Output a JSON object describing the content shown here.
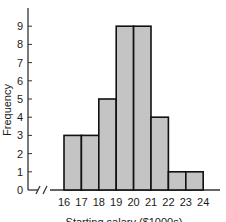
{
  "chart_data": {
    "type": "bar",
    "subtype": "histogram",
    "title": "",
    "xlabel": "Starting salary ($1000s)",
    "ylabel": "Frequency",
    "x_tick_labels": [
      "16",
      "17",
      "18",
      "19",
      "20",
      "21",
      "22",
      "23",
      "24"
    ],
    "y_tick_labels": [
      "0",
      "1",
      "2",
      "3",
      "4",
      "5",
      "6",
      "7",
      "8",
      "9"
    ],
    "bins": [
      {
        "from": 16,
        "to": 17,
        "count": 3
      },
      {
        "from": 17,
        "to": 18,
        "count": 3
      },
      {
        "from": 18,
        "to": 19,
        "count": 5
      },
      {
        "from": 19,
        "to": 20,
        "count": 9
      },
      {
        "from": 20,
        "to": 21,
        "count": 9
      },
      {
        "from": 21,
        "to": 22,
        "count": 4
      },
      {
        "from": 22,
        "to": 23,
        "count": 1
      },
      {
        "from": 23,
        "to": 24,
        "count": 1
      }
    ],
    "categories": [
      "16-17",
      "17-18",
      "18-19",
      "19-20",
      "20-21",
      "21-22",
      "22-23",
      "23-24"
    ],
    "values": [
      3,
      3,
      5,
      9,
      9,
      4,
      1,
      1
    ],
    "ylim": [
      0,
      9
    ],
    "xlim": [
      16,
      24
    ],
    "axis_break": true,
    "grid": false,
    "legend": null,
    "colors": {
      "bar_fill": "#c4c4c4",
      "bar_stroke": "#111111",
      "axis": "#333333"
    }
  }
}
